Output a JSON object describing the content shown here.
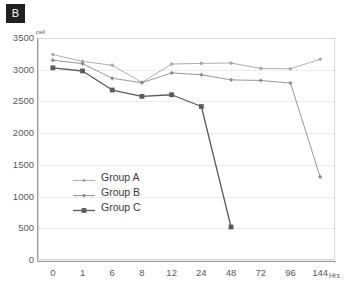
{
  "panel": {
    "label": "B"
  },
  "chart_data": {
    "type": "line",
    "title": "",
    "xlabel": "Hrs",
    "ylabel": "cell",
    "ylim": [
      0,
      3500
    ],
    "yticks": [
      0,
      500,
      1000,
      1500,
      2000,
      2500,
      3000,
      3500
    ],
    "grid": true,
    "legend_position": "inside-left",
    "categories": [
      "0",
      "1",
      "6",
      "8",
      "12",
      "24",
      "48",
      "72",
      "96",
      "144"
    ],
    "series": [
      {
        "name": "Group A",
        "color": "#a6a6a6",
        "marker": "diamond",
        "values": [
          3240,
          3130,
          3070,
          2800,
          3090,
          3100,
          3105,
          3020,
          3015,
          3165
        ]
      },
      {
        "name": "Group B",
        "color": "#8c8c8c",
        "marker": "diamond",
        "values": [
          3150,
          3095,
          2865,
          2795,
          2950,
          2920,
          2840,
          2830,
          2790,
          1310
        ]
      },
      {
        "name": "Group C",
        "color": "#5a5a5a",
        "marker": "square",
        "values": [
          3030,
          2980,
          2680,
          2580,
          2605,
          2420,
          520,
          null,
          null,
          null
        ]
      }
    ]
  },
  "axes": {
    "y_unit_superscript": "cell",
    "x_unit": "Hrs"
  },
  "colors": {
    "badge_bg": "#231f20",
    "badge_text": "#ffffff",
    "grid": "#ececec",
    "axis": "#9a9a9a",
    "tick_text": "#59595b",
    "legend_text": "#3a3a3c"
  }
}
